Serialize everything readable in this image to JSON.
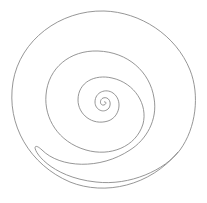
{
  "diagram": {
    "title": "",
    "shape": "spiral",
    "stroke_color": "#8a8a8a",
    "background": "#ffffff",
    "center": [
      104,
      102
    ],
    "turns": 4
  }
}
